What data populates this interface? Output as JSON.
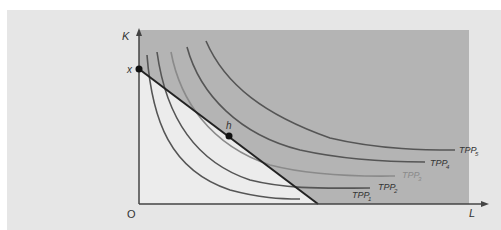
{
  "diagram": {
    "axes": {
      "y_label": "K",
      "x_label": "L",
      "origin_label": "O"
    },
    "points": {
      "x_intercept_label": "x",
      "optimum_label": "h"
    },
    "curves": [
      {
        "label": "TPP",
        "sub": "1"
      },
      {
        "label": "TPP",
        "sub": "2"
      },
      {
        "label": "TPP",
        "sub": "3"
      },
      {
        "label": "TPP",
        "sub": "4"
      },
      {
        "label": "TPP",
        "sub": "5"
      }
    ],
    "colors": {
      "panel_background": "#e6e6e6",
      "shaded_region": "#b4b4b4",
      "feasible_region": "#ececec",
      "curve_stroke": "#555555",
      "highlight_curve_stroke": "#8a8a8a",
      "budget_line": "#222222"
    }
  }
}
